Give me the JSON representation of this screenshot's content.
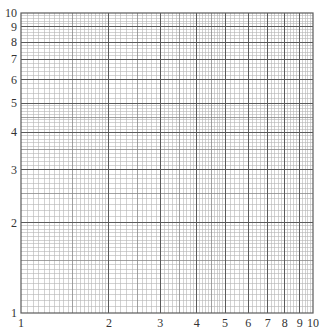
{
  "chart_data": {
    "type": "line",
    "title": "",
    "xlabel": "",
    "ylabel": "",
    "xscale": "log",
    "yscale": "log",
    "xlim": [
      1,
      10
    ],
    "ylim": [
      1,
      10
    ],
    "grid": true,
    "x_tick_labels": [
      "1",
      "2",
      "3",
      "4",
      "5",
      "6",
      "7",
      "8",
      "9",
      "10"
    ],
    "y_tick_labels": [
      "1",
      "2",
      "3",
      "4",
      "5",
      "6",
      "7",
      "8",
      "9",
      "10"
    ],
    "x_ticks": [
      1,
      2,
      3,
      4,
      5,
      6,
      7,
      8,
      9,
      10
    ],
    "y_ticks": [
      1,
      2,
      3,
      4,
      5,
      6,
      7,
      8,
      9,
      10
    ],
    "series": []
  },
  "style": {
    "background": "#ffffff",
    "minor_grid_color": "#b4b4b4",
    "mid_grid_color": "#8a8a8a",
    "major_grid_color": "#5a5a5a",
    "label_color": "#333333"
  },
  "layout": {
    "plot_left": 21,
    "plot_top": 13,
    "plot_width": 292,
    "plot_height": 300
  }
}
